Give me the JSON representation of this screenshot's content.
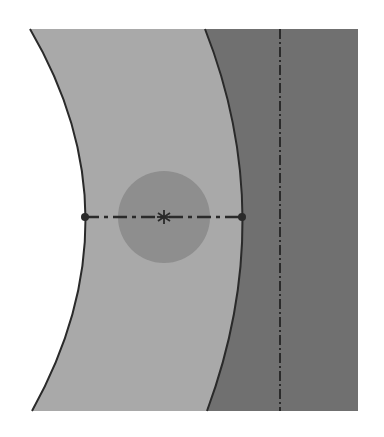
{
  "diagram": {
    "type": "cross-section-sketch",
    "colors": {
      "background": "#ffffff",
      "outer_band": "#a9a9a9",
      "inner_region": "#707070",
      "circle": "#8e8e8e",
      "outline": "#2a2a2a",
      "centerline": "#2a2a2a"
    },
    "outer_band": {
      "left_curve": {
        "top": [
          30,
          29
        ],
        "mid": [
          85,
          217
        ],
        "bottom": [
          32,
          411
        ]
      },
      "right_curve": {
        "top": [
          205,
          29
        ],
        "mid": [
          242,
          217
        ],
        "bottom": [
          207,
          411
        ]
      }
    },
    "inner_region": {
      "x_left_curve": "right_curve",
      "x_right": 358,
      "y_top": 29,
      "y_bottom": 411
    },
    "vertical_centerline": {
      "x": 280,
      "y1": 29,
      "y2": 411,
      "style": "dash-dot"
    },
    "horizontal_centerline": {
      "x1": 85,
      "x2": 242,
      "y": 217,
      "style": "dash-dot"
    },
    "endpoints": [
      [
        85,
        217
      ],
      [
        242,
        217
      ]
    ],
    "circle": {
      "cx": 164,
      "cy": 217,
      "r": 46
    },
    "center_mark": {
      "x": 164,
      "y": 217,
      "glyph": "asterisk"
    }
  }
}
